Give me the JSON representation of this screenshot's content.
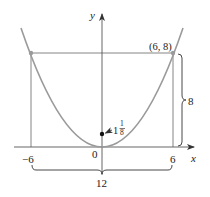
{
  "figure": {
    "type": "parabola-diagram",
    "equation": "y = 2x^2/9",
    "colors": {
      "curve": "#9a9a9a",
      "axes": "#555555",
      "guide_lines": "#777777",
      "points": "#9a9a9a",
      "focus": "#111111",
      "text": "#222222"
    }
  },
  "axes": {
    "x_label": "x",
    "y_label": "y",
    "origin_label": "0",
    "x_ticks": [
      {
        "value": -6,
        "label": "−6"
      },
      {
        "value": 6,
        "label": "6"
      }
    ]
  },
  "points": {
    "right_point": {
      "x": 6,
      "y": 8,
      "label": "(6, 8)"
    },
    "left_point": {
      "x": -6,
      "y": 8
    },
    "focus": {
      "x": 0,
      "y": 1.125,
      "label_whole": "1",
      "label_num": "1",
      "label_den": "8"
    }
  },
  "dimensions": {
    "height_brace_label": "8",
    "width_brace_label": "12"
  }
}
